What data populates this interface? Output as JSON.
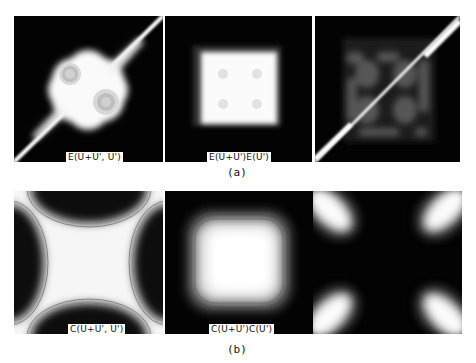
{
  "figure": {
    "row_a": {
      "caption": "(a)",
      "panels": [
        {
          "label": "E(U+U', U')",
          "description": "white region with two ringed blobs and diagonal streak"
        },
        {
          "label": "E(U+U')E(U')",
          "description": "bright white square centered on black"
        },
        {
          "label": "",
          "description": "dim gridded blobs with bright diagonal corner streaks"
        }
      ]
    },
    "row_b": {
      "caption": "(b)",
      "panels": [
        {
          "label": "C(U+U', U')",
          "description": "white X shape with dark lobes at edges"
        },
        {
          "label": "C(U+U')C(U')",
          "description": "bright rounded square with contour rings"
        },
        {
          "label": "",
          "description": "four bright corner lobes on dark background"
        }
      ]
    }
  },
  "colors": {
    "background": "#ffffff",
    "panel_dark": "#030303",
    "panel_bright": "#ffffff"
  }
}
